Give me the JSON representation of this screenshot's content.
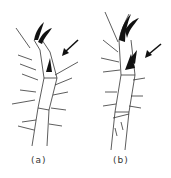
{
  "figure": {
    "panels": [
      {
        "id": "a",
        "label": "(a)",
        "description": "insect leg tarsus with claw and arrow pointing to tooth"
      },
      {
        "id": "b",
        "label": "(b)",
        "description": "insect leg tarsus with claw and arrow pointing to tooth"
      }
    ],
    "colors": {
      "ink": "#222222",
      "background": "#ffffff"
    }
  }
}
